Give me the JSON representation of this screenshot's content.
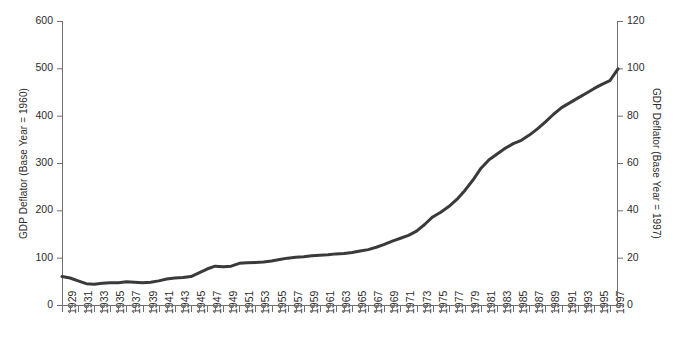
{
  "chart_data": {
    "type": "line",
    "title": "",
    "xlabel": "",
    "ylabel": "GDP Deflator (Base Year = 1960)",
    "ylabel_right": "GDP Deflator (Base Year = 1997)",
    "ylim": [
      0,
      600
    ],
    "ylim_right": [
      0,
      120
    ],
    "yticks": [
      0,
      100,
      200,
      300,
      400,
      500,
      600
    ],
    "yticks_right": [
      0,
      20,
      40,
      60,
      80,
      100,
      120
    ],
    "grid": false,
    "legend": "none",
    "line_color": "#3a3a3a",
    "axis_color": "#6f6f6f",
    "xlim": [
      1929,
      1998
    ],
    "x": [
      1929,
      1930,
      1931,
      1932,
      1933,
      1934,
      1935,
      1936,
      1937,
      1938,
      1939,
      1940,
      1941,
      1942,
      1943,
      1944,
      1945,
      1946,
      1947,
      1948,
      1949,
      1950,
      1951,
      1952,
      1953,
      1954,
      1955,
      1956,
      1957,
      1958,
      1959,
      1960,
      1961,
      1962,
      1963,
      1964,
      1965,
      1966,
      1967,
      1968,
      1969,
      1970,
      1971,
      1972,
      1973,
      1974,
      1975,
      1976,
      1977,
      1978,
      1979,
      1980,
      1981,
      1982,
      1983,
      1984,
      1985,
      1986,
      1987,
      1988,
      1989,
      1990,
      1991,
      1992,
      1993,
      1994,
      1995,
      1996,
      1997,
      1998
    ],
    "values": [
      60,
      57,
      51,
      45,
      44,
      46,
      47,
      47,
      49,
      48,
      47,
      48,
      51,
      55,
      57,
      58,
      60,
      68,
      76,
      82,
      81,
      82,
      88,
      89,
      90,
      91,
      93,
      96,
      99,
      101,
      102,
      104,
      105,
      106,
      108,
      109,
      111,
      114,
      117,
      122,
      128,
      135,
      141,
      147,
      156,
      170,
      186,
      196,
      208,
      223,
      242,
      264,
      289,
      307,
      319,
      331,
      341,
      348,
      359,
      372,
      387,
      403,
      417,
      427,
      437,
      447,
      457,
      466,
      474,
      499
    ]
  },
  "axes": {
    "left": {
      "title": "GDP Deflator (Base Year = 1960)",
      "ticks": [
        "0",
        "100",
        "200",
        "300",
        "400",
        "500",
        "600"
      ]
    },
    "right": {
      "title": "GDP Deflator (Base Year = 1997)",
      "ticks": [
        "0",
        "20",
        "40",
        "60",
        "80",
        "100",
        "120"
      ]
    },
    "bottom": {
      "ticks": [
        "1929",
        "1931",
        "1933",
        "1935",
        "1937",
        "1939",
        "1941",
        "1943",
        "1945",
        "1947",
        "1949",
        "1951",
        "1953",
        "1955",
        "1957",
        "1959",
        "1961",
        "1963",
        "1965",
        "1967",
        "1969",
        "1971",
        "1973",
        "1975",
        "1977",
        "1979",
        "1981",
        "1983",
        "1985",
        "1987",
        "1989",
        "1991",
        "1993",
        "1995",
        "1997"
      ]
    }
  }
}
